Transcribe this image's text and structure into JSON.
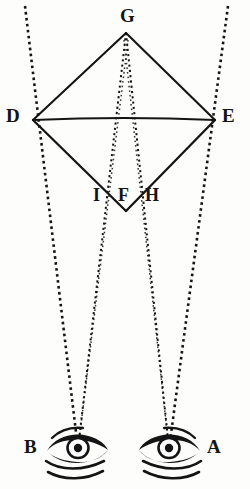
{
  "figure": {
    "name": "binocular-vision-diamond-diagram",
    "width": 250,
    "height": 489,
    "background_color": "#fdfdfb",
    "ink_color": "#141414"
  },
  "points": [
    {
      "id": "G",
      "label": "G",
      "x": 126,
      "y": 32,
      "label_x": 120,
      "label_y": 6,
      "font_size": 19,
      "role": "diamond-apex-top"
    },
    {
      "id": "D",
      "label": "D",
      "x": 33,
      "y": 120,
      "label_x": 6,
      "label_y": 106,
      "font_size": 19,
      "role": "diamond-vertex-left"
    },
    {
      "id": "E",
      "label": "E",
      "x": 215,
      "y": 120,
      "label_x": 222,
      "label_y": 106,
      "font_size": 19,
      "role": "diamond-vertex-right"
    },
    {
      "id": "F",
      "label": "F",
      "x": 126,
      "y": 211,
      "label_x": 118,
      "label_y": 186,
      "font_size": 18,
      "role": "diamond-apex-bottom"
    },
    {
      "id": "I",
      "label": "I",
      "x": 110,
      "y": 197,
      "label_x": 92,
      "label_y": 186,
      "font_size": 18,
      "role": "left-crossing-point"
    },
    {
      "id": "H",
      "label": "H",
      "x": 143,
      "y": 197,
      "label_x": 145,
      "label_y": 186,
      "font_size": 18,
      "role": "right-crossing-point"
    },
    {
      "id": "B",
      "label": "B",
      "x": 78,
      "y": 449,
      "label_x": 24,
      "label_y": 437,
      "font_size": 19,
      "role": "left-eye"
    },
    {
      "id": "A",
      "label": "A",
      "x": 169,
      "y": 449,
      "label_x": 207,
      "label_y": 437,
      "font_size": 19,
      "role": "right-eye"
    }
  ],
  "solid_lines": [
    {
      "name": "edge-G-D",
      "from": "G",
      "to": "D"
    },
    {
      "name": "edge-G-E",
      "from": "G",
      "to": "E"
    },
    {
      "name": "edge-D-F",
      "from": "D",
      "to": "F"
    },
    {
      "name": "edge-E-F",
      "from": "E",
      "to": "F"
    },
    {
      "name": "chord-D-E",
      "from": "D",
      "to": "E"
    }
  ],
  "dotted_rays": [
    {
      "name": "ray-outer-left",
      "x1": 25,
      "y1": 6,
      "x2": 78,
      "y2": 449,
      "description": "outer ray from upper-left through D down to eye B"
    },
    {
      "name": "ray-outer-right",
      "x1": 228,
      "y1": 6,
      "x2": 169,
      "y2": 449,
      "description": "outer ray from upper-right through E down to eye A"
    },
    {
      "name": "ray-inner-left",
      "x1": 126,
      "y1": 32,
      "x2": 78,
      "y2": 449,
      "description": "ray from apex G through H down to eye B"
    },
    {
      "name": "ray-inner-right",
      "x1": 126,
      "y1": 32,
      "x2": 169,
      "y2": 449,
      "description": "ray from apex G through I down to eye A"
    },
    {
      "name": "ray-cross-left",
      "x1": 110,
      "y1": 197,
      "x2": 78,
      "y2": 449,
      "description": "ray from I down to eye B"
    },
    {
      "name": "ray-cross-right",
      "x1": 143,
      "y1": 197,
      "x2": 169,
      "y2": 449,
      "description": "ray from H down to eye A"
    }
  ],
  "eyes": [
    {
      "name": "eye-left",
      "label": "B",
      "cx": 78,
      "cy": 449,
      "flip": false
    },
    {
      "name": "eye-right",
      "label": "A",
      "cx": 169,
      "cy": 449,
      "flip": true
    }
  ],
  "caption": ""
}
